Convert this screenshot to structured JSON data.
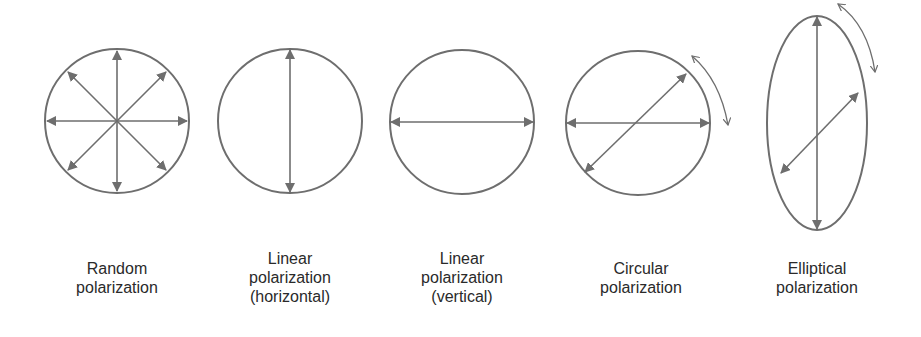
{
  "colors": {
    "stroke": "#6e6e6e",
    "text": "#2a2a2a",
    "background": "#ffffff"
  },
  "panels": [
    {
      "id": "random",
      "label_lines": [
        "Random",
        "polarization"
      ],
      "shape": "circle",
      "arrows": [
        "0",
        "45",
        "90",
        "135"
      ]
    },
    {
      "id": "linear-horizontal",
      "label_lines": [
        "Linear",
        "polarization",
        "(horizontal)"
      ],
      "shape": "circle",
      "arrows": [
        "90"
      ]
    },
    {
      "id": "linear-vertical",
      "label_lines": [
        "Linear",
        "polarization",
        "(vertical)"
      ],
      "shape": "circle",
      "arrows": [
        "0"
      ]
    },
    {
      "id": "circular",
      "label_lines": [
        "Circular",
        "polarization"
      ],
      "shape": "circle",
      "arrows": [
        "0",
        "40"
      ],
      "rotation_arrow": true
    },
    {
      "id": "elliptical",
      "label_lines": [
        "Elliptical",
        "polarization"
      ],
      "shape": "ellipse",
      "arrows": [
        "90",
        "40"
      ],
      "rotation_arrow": true
    }
  ]
}
